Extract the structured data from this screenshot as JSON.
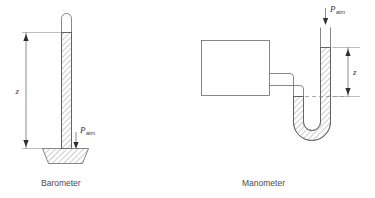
{
  "figure": {
    "background_color": "#ffffff",
    "line_color": "#555555",
    "text_color": "#4a4a4a"
  },
  "barometer": {
    "caption": "Barometer",
    "height_label": "z",
    "pressure_label": "P",
    "pressure_subscript": "atm",
    "parts": {
      "tube": "vertical-tube-closed-top",
      "vacuum_space": "evacuated-space-at-top",
      "fluid": "mercury-column-hatched",
      "reservoir": "trapezoidal-dish-reservoir"
    }
  },
  "manometer": {
    "caption": "Manometer",
    "height_label": "z",
    "pressure_label": "P",
    "pressure_subscript": "atm",
    "parts": {
      "vessel": "rectangular-pressure-vessel",
      "connector": "stepped-connecting-pipe",
      "u_tube": "u-shaped-tube",
      "fluid": "manometer-fluid-hatched",
      "reference_level": "dashed-fluid-level-line",
      "open_end": "open-to-atmosphere-right-leg"
    }
  }
}
